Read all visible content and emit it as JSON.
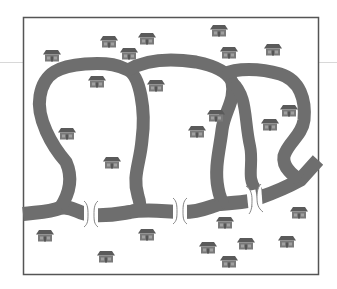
{
  "figure": {
    "colors": {
      "background": "#ffffff",
      "frame": "#555555",
      "river": "#6e6e6e",
      "house_roof": "#5a5a5a",
      "house_wall": "#7a7a7a",
      "bridge": "#888888",
      "scanline": "#d8d8d8"
    },
    "frame": {
      "x": 23,
      "y": 17,
      "width": 295,
      "height": 257
    },
    "bridges": [
      {
        "name": "bridge-left",
        "x": 91,
        "y": 214
      },
      {
        "name": "bridge-middle",
        "x": 180,
        "y": 211
      },
      {
        "name": "bridge-right",
        "x": 256,
        "y": 199
      }
    ],
    "houses": [
      {
        "x": 52,
        "y": 54
      },
      {
        "x": 109,
        "y": 40
      },
      {
        "x": 129,
        "y": 52
      },
      {
        "x": 147,
        "y": 37
      },
      {
        "x": 97,
        "y": 80
      },
      {
        "x": 67,
        "y": 132
      },
      {
        "x": 112,
        "y": 161
      },
      {
        "x": 219,
        "y": 29
      },
      {
        "x": 229,
        "y": 51
      },
      {
        "x": 273,
        "y": 48
      },
      {
        "x": 156,
        "y": 84
      },
      {
        "x": 216,
        "y": 114
      },
      {
        "x": 197,
        "y": 130
      },
      {
        "x": 289,
        "y": 109
      },
      {
        "x": 270,
        "y": 123
      },
      {
        "x": 45,
        "y": 234
      },
      {
        "x": 147,
        "y": 233
      },
      {
        "x": 106,
        "y": 255
      },
      {
        "x": 225,
        "y": 221
      },
      {
        "x": 299,
        "y": 211
      },
      {
        "x": 208,
        "y": 246
      },
      {
        "x": 246,
        "y": 242
      },
      {
        "x": 287,
        "y": 240
      },
      {
        "x": 229,
        "y": 260
      }
    ]
  }
}
